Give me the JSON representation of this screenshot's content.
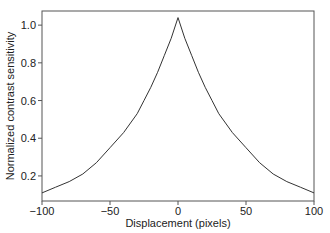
{
  "chart_data": {
    "type": "line",
    "title": "",
    "xlabel": "Displacement (pixels)",
    "ylabel": "Normalized contrast sensitivity",
    "xlim": [
      -100,
      100
    ],
    "ylim": [
      0.067,
      1.075
    ],
    "xticks": [
      -100,
      -50,
      0,
      50,
      100
    ],
    "xtick_labels": [
      "−100",
      "−50",
      "0",
      "50",
      "100"
    ],
    "yticks": [
      0.2,
      0.4,
      0.6,
      0.8,
      1.0
    ],
    "ytick_labels": [
      "0.2",
      "0.4",
      "0.6",
      "0.8",
      "1.0"
    ],
    "grid": false,
    "legend": null,
    "series": [
      {
        "name": "contrast sensitivity",
        "color": "#333333",
        "x": [
          -100,
          -90,
          -80,
          -70,
          -60,
          -50,
          -40,
          -30,
          -25,
          -20,
          -15,
          -10,
          -5,
          0,
          5,
          10,
          15,
          20,
          25,
          30,
          40,
          50,
          60,
          70,
          80,
          90,
          100
        ],
        "y": [
          0.11,
          0.14,
          0.17,
          0.21,
          0.27,
          0.35,
          0.43,
          0.53,
          0.6,
          0.67,
          0.75,
          0.84,
          0.93,
          1.04,
          0.93,
          0.84,
          0.75,
          0.67,
          0.6,
          0.53,
          0.43,
          0.35,
          0.27,
          0.21,
          0.17,
          0.14,
          0.11
        ]
      }
    ]
  }
}
